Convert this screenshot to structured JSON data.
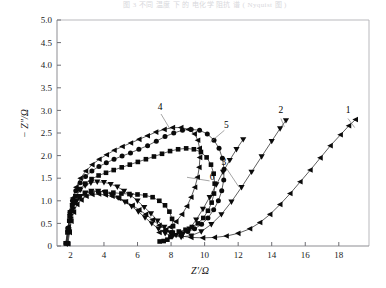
{
  "caption": "图 3  不同 温度 下 的 电化学 阻抗 谱 ( Nyquist 图 )",
  "axes": {
    "x_title": "Z′/Ω",
    "y_title": "− Z″/Ω",
    "x_ticks": [
      "2",
      "4",
      "6",
      "8",
      "10",
      "12",
      "14",
      "16",
      "18"
    ],
    "y_ticks": [
      "0",
      "0.5",
      "1.0",
      "1.5",
      "2.0",
      "2.5",
      "3.0",
      "3.5",
      "4.0",
      "4.5",
      "5.0"
    ],
    "xlim": [
      1.2,
      19.8
    ],
    "ylim": [
      0,
      5.0
    ]
  },
  "curve_labels": [
    {
      "id": "1",
      "text": "1"
    },
    {
      "id": "2",
      "text": "2"
    },
    {
      "id": "3",
      "text": "3"
    },
    {
      "id": "4",
      "text": "4"
    },
    {
      "id": "5",
      "text": "5"
    },
    {
      "id": "6",
      "text": "6"
    }
  ],
  "chart_data": {
    "type": "scatter",
    "title": "",
    "xlabel": "Z′/Ω",
    "ylabel": "− Z″/Ω",
    "xlim": [
      1.2,
      19.8
    ],
    "ylim": [
      0,
      5.0
    ],
    "xticks": [
      2,
      4,
      6,
      8,
      10,
      12,
      14,
      16,
      18
    ],
    "yticks": [
      0,
      0.5,
      1.0,
      1.5,
      2.0,
      2.5,
      3.0,
      3.5,
      4.0,
      4.5,
      5.0
    ],
    "grid": false,
    "legend": "inline-numeric-labels",
    "series": [
      {
        "name": "1",
        "marker": "triangle-left",
        "points": [
          [
            1.85,
            0.05
          ],
          [
            1.95,
            0.3
          ],
          [
            2.05,
            0.55
          ],
          [
            2.2,
            0.75
          ],
          [
            2.4,
            0.92
          ],
          [
            2.65,
            1.02
          ],
          [
            2.95,
            1.1
          ],
          [
            3.3,
            1.14
          ],
          [
            3.7,
            1.15
          ],
          [
            4.1,
            1.13
          ],
          [
            4.5,
            1.1
          ],
          [
            4.9,
            1.05
          ],
          [
            5.3,
            0.98
          ],
          [
            5.7,
            0.9
          ],
          [
            6.1,
            0.8
          ],
          [
            6.5,
            0.7
          ],
          [
            6.9,
            0.58
          ],
          [
            7.3,
            0.46
          ],
          [
            7.7,
            0.36
          ],
          [
            8.1,
            0.28
          ],
          [
            8.6,
            0.22
          ],
          [
            9.2,
            0.19
          ],
          [
            9.9,
            0.18
          ],
          [
            10.6,
            0.19
          ],
          [
            11.3,
            0.22
          ],
          [
            12.0,
            0.28
          ],
          [
            12.7,
            0.38
          ],
          [
            13.3,
            0.52
          ],
          [
            13.9,
            0.7
          ],
          [
            14.5,
            0.92
          ],
          [
            15.1,
            1.16
          ],
          [
            15.7,
            1.42
          ],
          [
            16.3,
            1.68
          ],
          [
            16.9,
            1.95
          ],
          [
            17.5,
            2.22
          ],
          [
            18.1,
            2.46
          ],
          [
            18.6,
            2.66
          ],
          [
            19.0,
            2.8
          ]
        ]
      },
      {
        "name": "2",
        "marker": "triangle-down",
        "points": [
          [
            1.82,
            0.05
          ],
          [
            1.92,
            0.32
          ],
          [
            2.02,
            0.6
          ],
          [
            2.16,
            0.82
          ],
          [
            2.36,
            0.99
          ],
          [
            2.6,
            1.1
          ],
          [
            2.9,
            1.18
          ],
          [
            3.25,
            1.22
          ],
          [
            3.65,
            1.22
          ],
          [
            4.05,
            1.19
          ],
          [
            4.45,
            1.14
          ],
          [
            4.85,
            1.07
          ],
          [
            5.25,
            0.98
          ],
          [
            5.65,
            0.88
          ],
          [
            6.05,
            0.76
          ],
          [
            6.45,
            0.63
          ],
          [
            6.85,
            0.5
          ],
          [
            7.25,
            0.38
          ],
          [
            7.65,
            0.28
          ],
          [
            8.1,
            0.22
          ],
          [
            8.6,
            0.2
          ],
          [
            9.2,
            0.23
          ],
          [
            9.8,
            0.32
          ],
          [
            10.4,
            0.48
          ],
          [
            11.0,
            0.7
          ],
          [
            11.6,
            0.98
          ],
          [
            12.2,
            1.3
          ],
          [
            12.8,
            1.64
          ],
          [
            13.4,
            1.98
          ],
          [
            14.0,
            2.32
          ],
          [
            14.5,
            2.6
          ],
          [
            14.85,
            2.78
          ]
        ]
      },
      {
        "name": "3",
        "marker": "triangle-down",
        "points": [
          [
            1.8,
            0.06
          ],
          [
            1.9,
            0.36
          ],
          [
            2.0,
            0.66
          ],
          [
            2.14,
            0.9
          ],
          [
            2.34,
            1.1
          ],
          [
            2.58,
            1.24
          ],
          [
            2.88,
            1.34
          ],
          [
            3.22,
            1.4
          ],
          [
            3.6,
            1.42
          ],
          [
            4.0,
            1.41
          ],
          [
            4.4,
            1.37
          ],
          [
            4.8,
            1.31
          ],
          [
            5.2,
            1.22
          ],
          [
            5.6,
            1.12
          ],
          [
            6.0,
            1.0
          ],
          [
            6.4,
            0.86
          ],
          [
            6.8,
            0.72
          ],
          [
            7.2,
            0.56
          ],
          [
            7.6,
            0.42
          ],
          [
            7.95,
            0.3
          ],
          [
            8.3,
            0.24
          ],
          [
            8.7,
            0.26
          ],
          [
            9.1,
            0.38
          ],
          [
            9.5,
            0.58
          ],
          [
            9.9,
            0.82
          ],
          [
            10.3,
            1.08
          ],
          [
            10.7,
            1.36
          ],
          [
            11.1,
            1.64
          ],
          [
            11.5,
            1.9
          ],
          [
            11.9,
            2.14
          ],
          [
            12.3,
            2.36
          ]
        ]
      },
      {
        "name": "4",
        "marker": "triangle-left",
        "points": [
          [
            1.78,
            0.06
          ],
          [
            1.88,
            0.42
          ],
          [
            1.99,
            0.78
          ],
          [
            2.14,
            1.06
          ],
          [
            2.34,
            1.3
          ],
          [
            2.6,
            1.5
          ],
          [
            2.92,
            1.66
          ],
          [
            3.3,
            1.8
          ],
          [
            3.72,
            1.92
          ],
          [
            4.16,
            2.02
          ],
          [
            4.62,
            2.12
          ],
          [
            5.1,
            2.2
          ],
          [
            5.6,
            2.28
          ],
          [
            6.1,
            2.36
          ],
          [
            6.6,
            2.44
          ],
          [
            7.1,
            2.52
          ],
          [
            7.6,
            2.58
          ],
          [
            8.1,
            2.62
          ],
          [
            8.6,
            2.62
          ],
          [
            9.05,
            2.58
          ],
          [
            9.4,
            2.48
          ],
          [
            9.6,
            2.34
          ],
          [
            9.7,
            2.16
          ],
          [
            9.72,
            1.96
          ],
          [
            9.68,
            1.74
          ],
          [
            9.58,
            1.52
          ],
          [
            9.42,
            1.3
          ],
          [
            9.2,
            1.08
          ],
          [
            8.95,
            0.88
          ],
          [
            8.65,
            0.7
          ],
          [
            8.3,
            0.54
          ],
          [
            7.95,
            0.42
          ],
          [
            7.6,
            0.34
          ],
          [
            7.3,
            0.3
          ]
        ]
      },
      {
        "name": "5",
        "marker": "circle",
        "points": [
          [
            1.76,
            0.06
          ],
          [
            1.86,
            0.4
          ],
          [
            1.97,
            0.74
          ],
          [
            2.12,
            1.0
          ],
          [
            2.32,
            1.22
          ],
          [
            2.58,
            1.4
          ],
          [
            2.9,
            1.54
          ],
          [
            3.28,
            1.66
          ],
          [
            3.7,
            1.76
          ],
          [
            4.14,
            1.84
          ],
          [
            4.6,
            1.92
          ],
          [
            5.08,
            1.99
          ],
          [
            5.58,
            2.06
          ],
          [
            6.08,
            2.14
          ],
          [
            6.6,
            2.22
          ],
          [
            7.12,
            2.32
          ],
          [
            7.64,
            2.42
          ],
          [
            8.16,
            2.5
          ],
          [
            8.68,
            2.56
          ],
          [
            9.2,
            2.58
          ],
          [
            9.7,
            2.56
          ],
          [
            10.16,
            2.48
          ],
          [
            10.56,
            2.34
          ],
          [
            10.86,
            2.16
          ],
          [
            11.06,
            1.94
          ],
          [
            11.16,
            1.7
          ],
          [
            11.14,
            1.46
          ],
          [
            11.02,
            1.22
          ],
          [
            10.82,
            1.0
          ],
          [
            10.54,
            0.8
          ],
          [
            10.2,
            0.62
          ],
          [
            9.82,
            0.48
          ],
          [
            9.4,
            0.38
          ],
          [
            9.0,
            0.32
          ],
          [
            8.6,
            0.28
          ]
        ]
      },
      {
        "name": "6",
        "marker": "square",
        "points": [
          [
            1.74,
            0.06
          ],
          [
            1.84,
            0.36
          ],
          [
            1.95,
            0.66
          ],
          [
            2.1,
            0.9
          ],
          [
            2.3,
            1.1
          ],
          [
            2.56,
            1.26
          ],
          [
            2.88,
            1.38
          ],
          [
            3.26,
            1.48
          ],
          [
            3.68,
            1.56
          ],
          [
            4.12,
            1.62
          ],
          [
            4.58,
            1.68
          ],
          [
            5.06,
            1.74
          ],
          [
            5.54,
            1.8
          ],
          [
            6.02,
            1.86
          ],
          [
            6.5,
            1.92
          ],
          [
            6.98,
            1.98
          ],
          [
            7.46,
            2.04
          ],
          [
            7.94,
            2.1
          ],
          [
            8.42,
            2.14
          ],
          [
            8.9,
            2.16
          ],
          [
            9.36,
            2.14
          ],
          [
            9.78,
            2.08
          ],
          [
            10.12,
            1.96
          ],
          [
            10.38,
            1.8
          ],
          [
            10.54,
            1.6
          ],
          [
            10.6,
            1.38
          ],
          [
            10.56,
            1.16
          ],
          [
            10.42,
            0.96
          ],
          [
            10.2,
            0.78
          ],
          [
            9.92,
            0.62
          ],
          [
            9.6,
            0.5
          ],
          [
            9.24,
            0.42
          ],
          [
            8.86,
            0.36
          ],
          [
            8.46,
            0.32
          ]
        ]
      },
      {
        "name": "7",
        "marker": "square",
        "points": [
          [
            1.72,
            0.06
          ],
          [
            1.82,
            0.3
          ],
          [
            1.93,
            0.56
          ],
          [
            2.08,
            0.78
          ],
          [
            2.28,
            0.96
          ],
          [
            2.54,
            1.08
          ],
          [
            2.86,
            1.16
          ],
          [
            3.24,
            1.2
          ],
          [
            3.66,
            1.21
          ],
          [
            4.1,
            1.2
          ],
          [
            4.56,
            1.18
          ],
          [
            5.04,
            1.16
          ],
          [
            5.52,
            1.15
          ],
          [
            6.0,
            1.14
          ],
          [
            6.46,
            1.12
          ],
          [
            6.9,
            1.08
          ],
          [
            7.3,
            1.0
          ],
          [
            7.64,
            0.9
          ],
          [
            7.9,
            0.76
          ],
          [
            8.06,
            0.6
          ],
          [
            8.12,
            0.44
          ],
          [
            8.08,
            0.3
          ],
          [
            7.96,
            0.2
          ],
          [
            7.78,
            0.14
          ],
          [
            7.56,
            0.11
          ],
          [
            7.32,
            0.1
          ]
        ]
      }
    ],
    "annotations": [
      {
        "label": "1",
        "x": 18.55,
        "y": 2.95
      },
      {
        "label": "2",
        "x": 14.55,
        "y": 2.95
      },
      {
        "label": "3",
        "x": 11.15,
        "y": 1.8
      },
      {
        "label": "4",
        "x": 7.35,
        "y": 3.0
      },
      {
        "label": "5",
        "x": 11.3,
        "y": 2.6
      },
      {
        "label": "6",
        "x": 10.45,
        "y": 1.45
      }
    ]
  }
}
